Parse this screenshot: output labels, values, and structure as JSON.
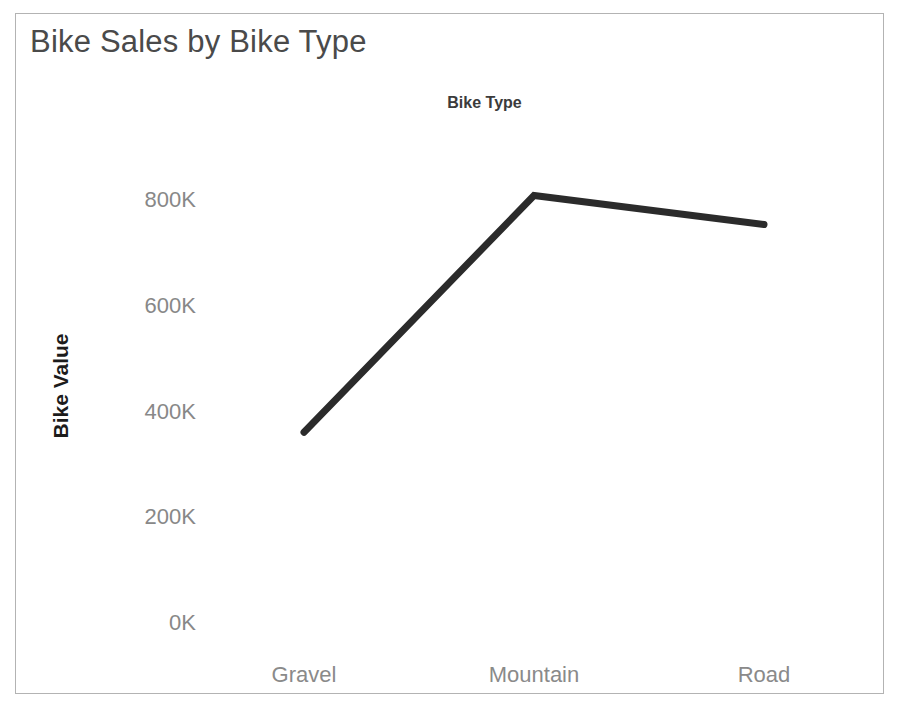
{
  "title": "Bike Sales by Bike Type",
  "x_field_header": "Bike Type",
  "y_axis_title": "Bike Value",
  "axis_labels": {
    "y": [
      "800K",
      "600K",
      "400K",
      "200K",
      "0K"
    ],
    "x": [
      "Gravel",
      "Mountain",
      "Road"
    ]
  },
  "colors": {
    "line": "#2b2b2b",
    "title_text": "#4a4a4a",
    "axis_text": "#888888",
    "header_text": "#3b3b3b",
    "y_title_text": "#1c1c1c",
    "border": "#b3b3b3",
    "background": "#ffffff"
  },
  "chart_data": {
    "type": "line",
    "title": "Bike Sales by Bike Type",
    "xlabel": "Bike Type",
    "ylabel": "Bike Value",
    "categories": [
      "Gravel",
      "Mountain",
      "Road"
    ],
    "values": [
      361000,
      809000,
      754000
    ],
    "value_labels": [
      "361K",
      "809K",
      "754K"
    ],
    "ytick_values": [
      800000,
      600000,
      400000,
      200000,
      0
    ],
    "ytick_labels": [
      "800K",
      "600K",
      "400K",
      "200K",
      "0K"
    ],
    "ylim": [
      0,
      880000
    ],
    "grid": false,
    "legend": false,
    "series": [
      {
        "name": "Bike Value",
        "values": [
          361000,
          809000,
          754000
        ]
      }
    ]
  }
}
